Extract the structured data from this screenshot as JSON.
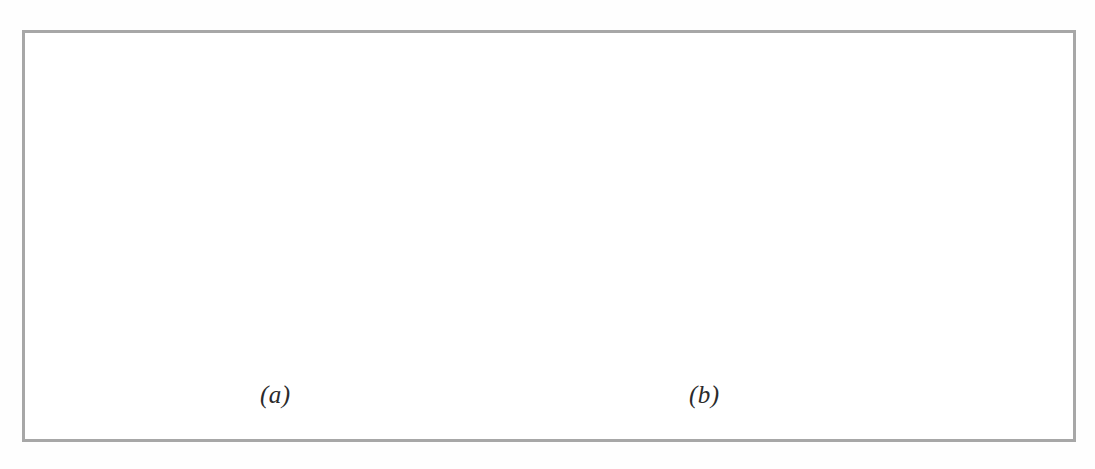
{
  "figure": {
    "domain": "scientific-illustration",
    "background_color": "#ffffff",
    "frame_color": "#a7a7a7",
    "lobe_fill_light": "#ffffff",
    "lobe_fill_shadow": "#9a9a9a",
    "ink_color": "#1a1a1a"
  },
  "panels": [
    {
      "id": "a",
      "label": "(a)",
      "label_x": 260,
      "label_y": 381,
      "description": "single atom with four sp3 hybrid orbital lobes and positive nucleus",
      "nucleus": {
        "symbol": "+",
        "cx": 285,
        "cy": 224,
        "r": 13
      },
      "lobe_count": 4
    },
    {
      "id": "b",
      "label": "(b)",
      "label_x": 689,
      "label_y": 381,
      "description": "two atoms sharing an electron pair in an overlapping sp3 orbital bond",
      "nuclei": [
        {
          "symbol": "+",
          "cx": 616,
          "cy": 227,
          "r": 13
        },
        {
          "symbol": "+",
          "cx": 824,
          "cy": 224,
          "r": 13
        }
      ],
      "electrons": [
        {
          "symbol": "−",
          "cx": 718,
          "cy": 206,
          "rx": 15,
          "ry": 9
        },
        {
          "symbol": "−",
          "cx": 718,
          "cy": 228,
          "rx": 15,
          "ry": 9
        }
      ],
      "bond_lines_style": "dashed",
      "lobe_count": 9
    }
  ],
  "legend": {
    "nucleus_symbol": "+",
    "electron_symbol": "−"
  }
}
